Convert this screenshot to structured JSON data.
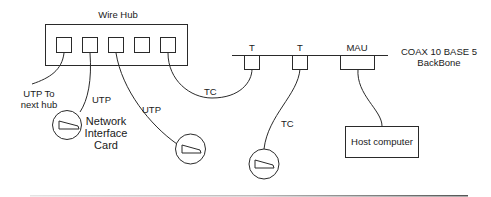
{
  "diagram": {
    "hub": {
      "title": "Wire Hub",
      "port_count": 5
    },
    "backbone": {
      "line1": "COAX 10 BASE 5",
      "line2": "BackBone"
    },
    "taps": [
      {
        "label": "T"
      },
      {
        "label": "T"
      },
      {
        "label": "MAU"
      }
    ],
    "cables": {
      "utp_next_hub_line1": "UTP To",
      "utp_next_hub_line2": "next hub",
      "utp_1": "UTP",
      "utp_2": "UTP",
      "tc_1": "TC",
      "tc_2": "TC"
    },
    "nic": {
      "line1": "Network",
      "line2": "Interface",
      "line3": "Card"
    },
    "host": {
      "label": "Host computer"
    },
    "colors": {
      "stroke": "#2a2a2a",
      "background": "#ffffff"
    }
  }
}
